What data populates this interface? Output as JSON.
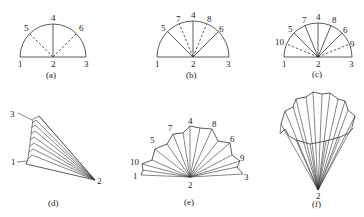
{
  "figure": {
    "panels": [
      {
        "id": "a",
        "caption": "(a)",
        "labels": {
          "p1": "1",
          "p2": "2",
          "p3": "3",
          "p4": "4",
          "p5": "5",
          "p6": "6"
        }
      },
      {
        "id": "b",
        "caption": "(b)",
        "labels": {
          "p1": "1",
          "p2": "2",
          "p3": "3",
          "p4": "4",
          "p5": "5",
          "p6": "6",
          "p7": "7",
          "p8": "8"
        }
      },
      {
        "id": "c",
        "caption": "(c)",
        "labels": {
          "p1": "1",
          "p2": "2",
          "p3": "3",
          "p4": "4",
          "p5": "5",
          "p6": "6",
          "p7": "7",
          "p8": "8",
          "p9": "9",
          "p10": "10"
        }
      },
      {
        "id": "d",
        "caption": "(d)",
        "labels": {
          "p1": "1",
          "p2": "2",
          "p3": "3"
        }
      },
      {
        "id": "e",
        "caption": "(e)",
        "labels": {
          "p1": "1",
          "p2": "2",
          "p3": "3",
          "p4": "4",
          "p5": "5",
          "p6": "6",
          "p7": "7",
          "p8": "8",
          "p9": "9",
          "p10": "10"
        }
      },
      {
        "id": "f",
        "caption": "(f)",
        "labels": {
          "p2": "2"
        }
      }
    ]
  }
}
